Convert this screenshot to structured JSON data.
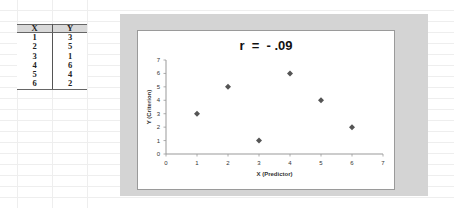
{
  "table": {
    "headers": [
      "X",
      "Y"
    ],
    "rows": [
      [
        "1",
        "3"
      ],
      [
        "2",
        "5"
      ],
      [
        "3",
        "1"
      ],
      [
        "4",
        "6"
      ],
      [
        "5",
        "4"
      ],
      [
        "6",
        "2"
      ]
    ]
  },
  "chart": {
    "title": "r  =  - .09",
    "xlabel": "X (Predictor)",
    "ylabel": "Y (Criterion)",
    "marker_color": "#555555"
  },
  "chart_data": {
    "type": "scatter",
    "title": "r  =  - .09",
    "xlabel": "X (Predictor)",
    "ylabel": "Y (Criterion)",
    "x": [
      1,
      2,
      3,
      4,
      5,
      6
    ],
    "y": [
      3,
      5,
      1,
      6,
      4,
      2
    ],
    "xlim": [
      0,
      7
    ],
    "ylim": [
      0,
      7
    ],
    "xticks": [
      "0",
      "1",
      "2",
      "3",
      "4",
      "5",
      "6",
      "7"
    ],
    "yticks": [
      "0",
      "1",
      "2",
      "3",
      "4",
      "5",
      "6",
      "7"
    ],
    "grid": false,
    "legend": null,
    "marker": "diamond"
  }
}
